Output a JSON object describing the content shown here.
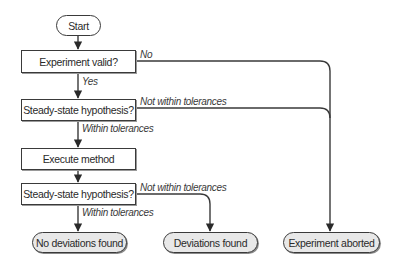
{
  "diagram": {
    "nodes": {
      "start": "Start",
      "experiment_valid": "Experiment valid?",
      "steady_state_1": "Steady-state hypothesis?",
      "execute_method": "Execute method",
      "steady_state_2": "Steady-state hypothesis?",
      "no_deviations": "No deviations found",
      "deviations_found": "Deviations found",
      "experiment_aborted": "Experiment aborted"
    },
    "edge_labels": {
      "no": "No",
      "yes": "Yes",
      "not_within_1": "Not within tolerances",
      "within_1": "Within tolerances",
      "not_within_2": "Not within tolerances",
      "within_2": "Within tolerances"
    },
    "colors": {
      "stroke": "#3a3a3a",
      "terminal_fill": "#e8e8e8",
      "box_fill": "#ffffff"
    }
  }
}
